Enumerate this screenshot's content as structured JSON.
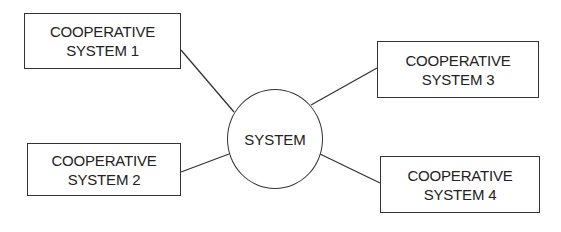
{
  "diagram": {
    "center": {
      "label": "SYSTEM"
    },
    "nodes": [
      {
        "line1": "COOPERATIVE",
        "line2": "SYSTEM 1"
      },
      {
        "line1": "COOPERATIVE",
        "line2": "SYSTEM 2"
      },
      {
        "line1": "COOPERATIVE",
        "line2": "SYSTEM 3"
      },
      {
        "line1": "COOPERATIVE",
        "line2": "SYSTEM 4"
      }
    ],
    "edges": [
      {
        "from": "COOPERATIVE SYSTEM 1",
        "to": "SYSTEM"
      },
      {
        "from": "COOPERATIVE SYSTEM 2",
        "to": "SYSTEM"
      },
      {
        "from": "COOPERATIVE SYSTEM 3",
        "to": "SYSTEM"
      },
      {
        "from": "COOPERATIVE SYSTEM 4",
        "to": "SYSTEM"
      }
    ],
    "line_color": "#333333"
  }
}
